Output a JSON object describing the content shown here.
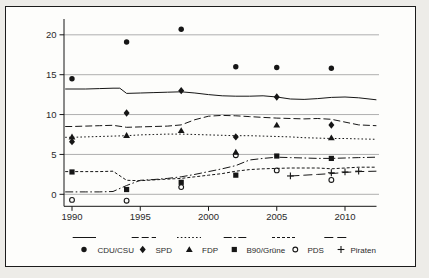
{
  "colors": {
    "ink": "#161616",
    "grid": "#a6a6a6",
    "paper": "#fdfdfb",
    "margin_bg": "#edece8",
    "border": "#1c1c1c"
  },
  "chart_data": {
    "type": "line",
    "title": "",
    "xlabel": "",
    "ylabel": "",
    "grid": "horizontal gray lines",
    "legend_position": "bottom",
    "x_axis": {
      "range": [
        1989.5,
        2012.3
      ],
      "ticks": [
        1990,
        1995,
        2000,
        2005,
        2010
      ],
      "tick_labels": [
        "1990",
        "1995",
        "2000",
        "2005",
        "2010"
      ]
    },
    "y_axis": {
      "range": [
        -1,
        21.5
      ],
      "ticks": [
        0,
        5,
        10,
        15,
        20
      ],
      "tick_labels": [
        "0",
        "5",
        "10",
        "15",
        "20"
      ]
    },
    "series": [
      {
        "name": "CDU/CSU",
        "line_style": "solid",
        "marker": "circle-filled",
        "line": {
          "x": [
            1989.5,
            1990,
            1991,
            1992,
            1993,
            1993.5,
            1994,
            1995,
            1996,
            1997,
            1998,
            1999,
            2000,
            2001,
            2002,
            2003,
            2004,
            2005,
            2006,
            2007,
            2008,
            2009,
            2010,
            2011,
            2012.3
          ],
          "y": [
            13.2,
            13.2,
            13.2,
            13.25,
            13.3,
            13.3,
            12.65,
            12.7,
            12.75,
            12.8,
            12.85,
            12.7,
            12.5,
            12.35,
            12.3,
            12.3,
            12.35,
            12.2,
            11.95,
            11.9,
            12.0,
            12.15,
            12.2,
            12.1,
            11.85
          ]
        },
        "points": {
          "x": [
            1990,
            1994,
            1998,
            2002,
            2005,
            2009
          ],
          "y": [
            14.5,
            19.1,
            20.7,
            16.0,
            15.9,
            15.8
          ]
        }
      },
      {
        "name": "SPD",
        "line_style": "dash",
        "marker": "diamond-filled",
        "line": {
          "x": [
            1989.5,
            1990,
            1991,
            1992,
            1993,
            1994,
            1995,
            1996,
            1997,
            1998,
            1999,
            2000,
            2001,
            2002,
            2003,
            2004,
            2005,
            2006,
            2007,
            2008,
            2009,
            2010,
            2011,
            2012.3
          ],
          "y": [
            8.5,
            8.5,
            8.55,
            8.6,
            8.65,
            8.4,
            8.45,
            8.5,
            8.55,
            8.7,
            9.35,
            9.8,
            9.9,
            9.85,
            9.75,
            9.65,
            9.55,
            9.5,
            9.45,
            9.5,
            9.4,
            9.05,
            8.7,
            8.6
          ]
        },
        "points": {
          "x": [
            1990,
            1994,
            1998,
            2002,
            2005,
            2009
          ],
          "y": [
            6.6,
            10.2,
            13.0,
            7.2,
            12.2,
            8.7
          ]
        }
      },
      {
        "name": "FDP",
        "line_style": "dot",
        "marker": "triangle-filled",
        "line": {
          "x": [
            1989.5,
            1990,
            1991,
            1992,
            1993,
            1994,
            1995,
            1996,
            1997,
            1998,
            1999,
            2000,
            2001,
            2002,
            2003,
            2004,
            2005,
            2006,
            2007,
            2008,
            2009,
            2010,
            2011,
            2012.3
          ],
          "y": [
            7.15,
            7.15,
            7.2,
            7.25,
            7.3,
            7.35,
            7.45,
            7.5,
            7.55,
            7.55,
            7.5,
            7.45,
            7.4,
            7.35,
            7.35,
            7.3,
            7.25,
            7.2,
            7.1,
            7.05,
            7.0,
            7.0,
            6.95,
            6.9
          ]
        },
        "points": {
          "x": [
            1990,
            1994,
            1998,
            2002,
            2005,
            2009
          ],
          "y": [
            7.2,
            7.4,
            8.0,
            5.3,
            8.7,
            7.1
          ]
        }
      },
      {
        "name": "B90/Grüne",
        "line_style": "dashdot",
        "marker": "square-filled",
        "line": {
          "x": [
            1989.5,
            1990,
            1991,
            1992,
            1993,
            1994,
            1995,
            1996,
            1997,
            1998,
            1999,
            2000,
            2001,
            2002,
            2003,
            2004,
            2005,
            2006,
            2007,
            2008,
            2009,
            2010,
            2011,
            2012.3
          ],
          "y": [
            0.3,
            0.3,
            0.3,
            0.3,
            0.35,
            1.1,
            1.75,
            1.85,
            2.0,
            2.2,
            2.5,
            2.85,
            3.2,
            3.6,
            4.3,
            4.5,
            4.65,
            4.6,
            4.55,
            4.5,
            4.5,
            4.55,
            4.6,
            4.65
          ]
        },
        "points": {
          "x": [
            1990,
            1994,
            1998,
            2002,
            2005,
            2009
          ],
          "y": [
            2.8,
            0.6,
            1.5,
            2.4,
            4.8,
            4.5
          ]
        }
      },
      {
        "name": "PDS",
        "line_style": "shortdash",
        "marker": "circle-open",
        "line": {
          "x": [
            1989.5,
            1990,
            1991,
            1992,
            1993,
            1994,
            1995,
            1996,
            1997,
            1998,
            1999,
            2000,
            2001,
            2002,
            2003,
            2004,
            2005,
            2006,
            2007,
            2008,
            2009,
            2010,
            2011,
            2012.3
          ],
          "y": [
            2.85,
            2.85,
            2.85,
            2.85,
            2.9,
            1.75,
            1.7,
            1.8,
            1.9,
            2.0,
            2.2,
            2.4,
            2.6,
            2.9,
            3.1,
            3.2,
            3.25,
            3.3,
            3.3,
            3.3,
            3.2,
            3.3,
            3.4,
            3.4
          ]
        },
        "points": {
          "x": [
            1990,
            1994,
            1998,
            2002,
            2005,
            2009
          ],
          "y": [
            -0.7,
            -0.8,
            0.9,
            4.9,
            3.0,
            1.8
          ]
        }
      },
      {
        "name": "Piraten",
        "line_style": "longdash",
        "marker": "plus",
        "line": {
          "x": [
            2006,
            2007,
            2008,
            2009,
            2010,
            2011,
            2012.3
          ],
          "y": [
            2.3,
            2.4,
            2.5,
            2.6,
            2.75,
            2.85,
            2.9
          ]
        },
        "points": {
          "x": [
            2006,
            2009,
            2010,
            2011
          ],
          "y": [
            2.3,
            2.7,
            2.8,
            2.9
          ]
        }
      }
    ],
    "legend": {
      "items": [
        {
          "label": "CDU/CSU",
          "marker": "circle-filled",
          "line_style": "solid"
        },
        {
          "label": "SPD",
          "marker": "diamond-filled",
          "line_style": "dash"
        },
        {
          "label": "FDP",
          "marker": "triangle-filled",
          "line_style": "dot"
        },
        {
          "label": "B90/Grüne",
          "marker": "square-filled",
          "line_style": "dashdot"
        },
        {
          "label": "PDS",
          "marker": "circle-open",
          "line_style": "shortdash"
        },
        {
          "label": "Piraten",
          "marker": "plus",
          "line_style": "longdash"
        }
      ]
    }
  }
}
